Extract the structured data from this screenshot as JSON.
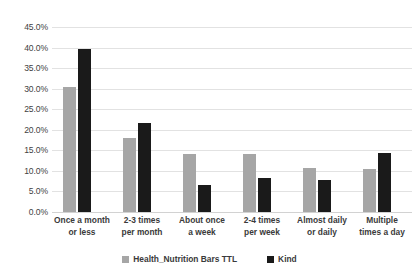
{
  "chart_data": {
    "type": "bar",
    "title": "",
    "subtitle": "",
    "xlabel": "",
    "ylabel": "",
    "ylim": [
      0,
      45
    ],
    "ytick_step": 5,
    "ytick_labels": [
      "0.0%",
      "5.0%",
      "10.0%",
      "15.0%",
      "20.0%",
      "25.0%",
      "30.0%",
      "35.0%",
      "40.0%",
      "45.0%"
    ],
    "ytick_values": [
      0,
      5,
      10,
      15,
      20,
      25,
      30,
      35,
      40,
      45
    ],
    "grid": true,
    "grid_axis": "y",
    "legend_position": "bottom",
    "value_format": "percent",
    "categories": [
      "Once a month or less",
      "2-3 times per month",
      "About once a week",
      "2-4 times per week",
      "Almost daily or daily",
      "Multiple times a day"
    ],
    "category_lines": [
      [
        "Once a month",
        "or less"
      ],
      [
        "2-3 times",
        "per month"
      ],
      [
        "About once",
        "a week"
      ],
      [
        "2-4 times",
        "per week"
      ],
      [
        "Almost daily",
        "or daily"
      ],
      [
        "Multiple",
        "times a day"
      ]
    ],
    "series": [
      {
        "name": "Health_Nutrition Bars TTL",
        "color": "#a6a6a6",
        "values": [
          30.3,
          18.0,
          14.2,
          14.0,
          10.6,
          10.4
        ]
      },
      {
        "name": "Kind",
        "color": "#1a1a1a",
        "values": [
          39.6,
          21.7,
          6.6,
          8.3,
          7.7,
          14.3
        ]
      }
    ]
  },
  "legend": {
    "items": [
      {
        "label": "Health_Nutrition Bars TTL",
        "color": "#a6a6a6"
      },
      {
        "label": "Kind",
        "color": "#1a1a1a"
      }
    ]
  },
  "colors": {
    "background": "#ffffff",
    "gridline": "#e2e2e2",
    "text": "#3a3a3a",
    "series_gray": "#a6a6a6",
    "series_black": "#1a1a1a"
  }
}
